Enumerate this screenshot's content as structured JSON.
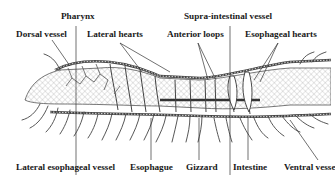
{
  "diagram": {
    "colors": {
      "ink": "#2a2a2a",
      "hatch": "#8a8a8a",
      "background": "#ffffff"
    },
    "labels_top": [
      {
        "id": "pharynx",
        "text": "Pharynx"
      },
      {
        "id": "dorsal-vessel",
        "text": "Dorsal vessel"
      },
      {
        "id": "lateral-hearts",
        "text": "Lateral hearts"
      },
      {
        "id": "supra-intestinal-vessel",
        "text": "Supra-intestinal vessel"
      },
      {
        "id": "anterior-loops",
        "text": "Anterior loops"
      },
      {
        "id": "esophageal-hearts",
        "text": "Esophageal hearts"
      }
    ],
    "labels_bottom": [
      {
        "id": "lateral-esophageal-vessel",
        "text": "Lateral esophageal vessel"
      },
      {
        "id": "esophague",
        "text": "Esophague"
      },
      {
        "id": "gizzard",
        "text": "Gizzard"
      },
      {
        "id": "intestine",
        "text": "Intestine"
      },
      {
        "id": "ventral-vessel",
        "text": "Ventral vesse"
      }
    ]
  }
}
